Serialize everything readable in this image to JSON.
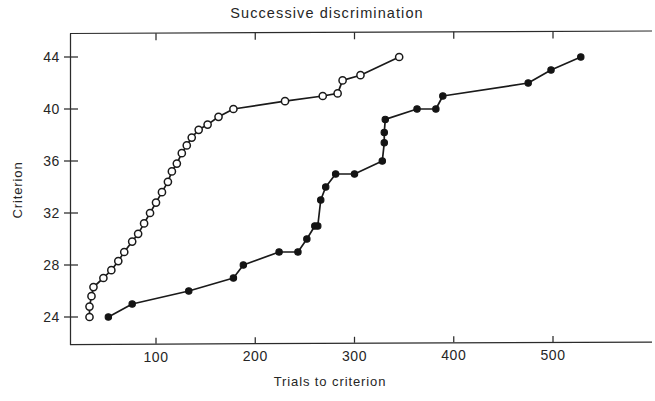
{
  "chart_data": {
    "type": "line",
    "title": "Successive discrimination",
    "xlabel": "Trials to criterion",
    "ylabel": "Criterion",
    "xlim": [
      0,
      590
    ],
    "ylim": [
      22.5,
      45.5
    ],
    "xticks": [
      100,
      200,
      300,
      400,
      500
    ],
    "yticks": [
      24,
      28,
      32,
      36,
      40,
      44
    ],
    "grid": false,
    "legend": "none",
    "series": [
      {
        "name": "open-circles",
        "marker": "open circle",
        "points": [
          [
            33,
            24.0
          ],
          [
            33,
            24.8
          ],
          [
            35,
            25.6
          ],
          [
            37,
            26.3
          ],
          [
            47,
            27.0
          ],
          [
            55,
            27.6
          ],
          [
            62,
            28.3
          ],
          [
            68,
            29.0
          ],
          [
            76,
            29.8
          ],
          [
            82,
            30.4
          ],
          [
            88,
            31.2
          ],
          [
            94,
            32.0
          ],
          [
            100,
            32.8
          ],
          [
            106,
            33.6
          ],
          [
            112,
            34.4
          ],
          [
            116,
            35.2
          ],
          [
            121,
            35.8
          ],
          [
            126,
            36.6
          ],
          [
            131,
            37.2
          ],
          [
            136,
            37.8
          ],
          [
            143,
            38.4
          ],
          [
            152,
            38.8
          ],
          [
            163,
            39.4
          ],
          [
            178,
            40.0
          ],
          [
            230,
            40.6
          ],
          [
            268,
            41.0
          ],
          [
            283,
            41.2
          ],
          [
            288,
            42.2
          ],
          [
            306,
            42.6
          ],
          [
            345,
            44.0
          ]
        ]
      },
      {
        "name": "filled-circles",
        "marker": "filled circle",
        "points": [
          [
            52,
            24.0
          ],
          [
            76,
            25.0
          ],
          [
            133,
            26.0
          ],
          [
            178,
            27.0
          ],
          [
            188,
            28.0
          ],
          [
            224,
            29.0
          ],
          [
            243,
            29.0
          ],
          [
            252,
            30.0
          ],
          [
            260,
            31.0
          ],
          [
            263,
            31.0
          ],
          [
            266,
            33.0
          ],
          [
            271,
            34.0
          ],
          [
            281,
            35.0
          ],
          [
            300,
            35.0
          ],
          [
            328,
            36.0
          ],
          [
            330,
            37.4
          ],
          [
            330,
            38.2
          ],
          [
            331,
            39.2
          ],
          [
            363,
            40.0
          ],
          [
            382,
            40.0
          ],
          [
            389,
            41.0
          ],
          [
            475,
            42.0
          ],
          [
            498,
            43.0
          ],
          [
            528,
            44.0
          ]
        ]
      }
    ]
  },
  "figure": {
    "title": "Successive discrimination",
    "x_axis_title": "Trials to criterion",
    "y_axis_title": "Criterion",
    "x_tick_labels": [
      "100",
      "200",
      "300",
      "400",
      "500"
    ],
    "y_tick_labels": [
      "44",
      "40",
      "36",
      "32",
      "28",
      "24"
    ]
  }
}
